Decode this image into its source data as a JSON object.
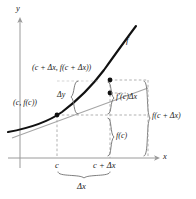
{
  "figure": {
    "colors": {
      "curve": "#111111",
      "tangent": "#8a8a8a",
      "dashed": "#9a9a9a",
      "axis": "#8f8f8f",
      "brace": "#6f6f6f",
      "text": "#1a1a1a",
      "background": "#ffffff"
    },
    "axes": {
      "y_label": "y",
      "x_label": "x"
    },
    "curve_label": "f",
    "points": [
      {
        "name": "point-c",
        "label": "(c, f(c))"
      },
      {
        "name": "point-c-plus-dx",
        "label": "(c + Δx, f(c + Δx))"
      }
    ],
    "labels": {
      "point_c": "(c, f(c))",
      "point_c_plus_dx": "(c + Δx, f(c + Δx))",
      "delta_y": "Δy",
      "f_prime_c_delta_x": "f′(c)Δx",
      "f_of_c": "f(c)",
      "f_of_c_plus_delta_x": "f(c + Δx)",
      "tick_c": "c",
      "tick_c_plus_delta_x": "c + Δx",
      "delta_x": "Δx",
      "curve": "f",
      "y_axis": "y",
      "x_axis": "x"
    },
    "braces": [
      {
        "name": "brace-delta-y",
        "label": "Δy",
        "orientation": "vertical-left"
      },
      {
        "name": "brace-f-prime-delta-x",
        "label": "f′(c)Δx",
        "orientation": "vertical-right"
      },
      {
        "name": "brace-f-of-c",
        "label": "f(c)",
        "orientation": "vertical-right"
      },
      {
        "name": "brace-f-of-c-plus-delta-x",
        "label": "f(c + Δx)",
        "orientation": "vertical-right"
      },
      {
        "name": "brace-delta-x",
        "label": "Δx",
        "orientation": "horizontal-bottom"
      }
    ]
  }
}
